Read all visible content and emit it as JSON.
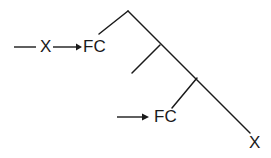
{
  "figure": {
    "type": "line-diagram",
    "background_color": "#ffffff",
    "stroke_color": "#1a1a1a",
    "labels": {
      "x_left": "X",
      "fc_top": "FC",
      "fc_bottom": "FC",
      "x_bottom": "X"
    },
    "annotations": [
      {
        "name": "top-annotation-row",
        "leader_line": "plain-line",
        "label_a": "X",
        "arrow": "right-arrow",
        "label_b": "FC"
      },
      {
        "name": "bottom-annotation-row",
        "arrow": "right-arrow",
        "label_b": "FC"
      }
    ],
    "strokes": {
      "apex": [
        128,
        11
      ],
      "left_branch_end": [
        99,
        34
      ],
      "junction_one": [
        160,
        45
      ],
      "branch_one_end": [
        132,
        73
      ],
      "junction_two": [
        197,
        78
      ],
      "branch_two_end": [
        172,
        108
      ],
      "main_diagonal_end": [
        250,
        133
      ]
    }
  }
}
